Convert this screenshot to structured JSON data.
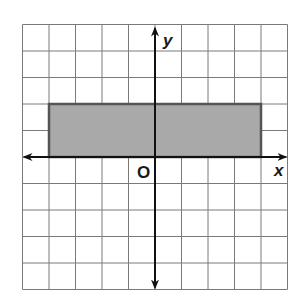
{
  "diagram": {
    "type": "coordinate-plane",
    "grid": {
      "x_min": -5,
      "x_max": 5,
      "y_min": -5,
      "y_max": 5,
      "cell_px": 26.5
    },
    "axes": {
      "x_label": "x",
      "y_label": "y",
      "origin_label": "O"
    },
    "shape": {
      "type": "rectangle",
      "vertices": [
        [
          -4,
          0
        ],
        [
          4,
          0
        ],
        [
          4,
          2
        ],
        [
          -4,
          2
        ]
      ],
      "fill": "#a9a9a9",
      "stroke": "#555555"
    },
    "colors": {
      "grid": "#7a7a7a",
      "axis": "#111111",
      "background": "#ffffff"
    }
  }
}
